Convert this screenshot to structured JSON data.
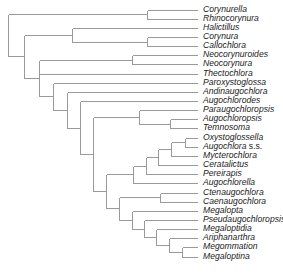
{
  "figure": {
    "type": "phylogenetic-cladogram",
    "line_color": "#9a9a9a",
    "text_color": "#222222"
  },
  "taxa": [
    "Corynurella",
    "Rhinocorynura",
    "Halictillus",
    "Corynura",
    "Callochlora",
    "Neocorynuroides",
    "Neocorynura",
    "Thectochlora",
    "Paroxystoglossa",
    "Andinaugochlora",
    "Augochlorodes",
    "Paraugochloropsis",
    "Augochloropsis",
    "Temnosoma",
    "Oxystoglossella",
    "Augochlora s.s.",
    "Mycterochlora",
    "Ceratalictus",
    "Pereirapis",
    "Augochlorella",
    "Ctenaugochlora",
    "Caenaugochlora",
    "Megalopta",
    "Pseudaugochloropsis",
    "Megaloptidia",
    "Ariphanarthra",
    "Megommation",
    "Megaloptina"
  ],
  "tree": {
    "newick": "((Corynurella,Rhinocorynura),((Halictillus,(Corynura,Callochlora)),((Neocorynuroides,Neocorynura),Thectochlora,(Paroxystoglossa,(Andinaugochlora,(Augochlorodes,((Paraugochloropsis,(Augochloropsis,Temnosoma)),(((((Oxystoglossella,Augochlora s.s.),Mycterochlora),Ceratalictus),Pereirapis),Augochlorella),((Ctenaugochlora,Caenaugochlora),(Megalopta,(Pseudaugochloropsis,(Megaloptidia,(Ariphanarthra,(Megommation,Megaloptina))))))))))))"
  }
}
